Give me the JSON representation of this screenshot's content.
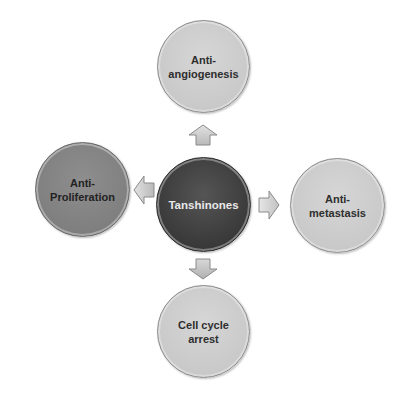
{
  "diagram": {
    "type": "radial-hub-and-spoke",
    "center": {
      "label": "Tanshinones"
    },
    "nodes": [
      {
        "position": "top",
        "label": "Anti-\nangiogenesis",
        "line1": "Anti-",
        "line2": "angiogenesis"
      },
      {
        "position": "left",
        "label": "Anti-\nProliferation",
        "line1": "Anti-",
        "line2": "Proliferation"
      },
      {
        "position": "right",
        "label": "Anti-\nmetastasis",
        "line1": "Anti-",
        "line2": "metastasis"
      },
      {
        "position": "bottom",
        "label": "Cell cycle\narrest",
        "line1": "Cell cycle",
        "line2": "arrest"
      }
    ],
    "arrows": [
      {
        "from": "Tanshinones",
        "to": "Anti-angiogenesis",
        "direction": "up"
      },
      {
        "from": "Tanshinones",
        "to": "Anti-Proliferation",
        "direction": "left"
      },
      {
        "from": "Tanshinones",
        "to": "Anti-metastasis",
        "direction": "right"
      },
      {
        "from": "Tanshinones",
        "to": "Cell cycle arrest",
        "direction": "down"
      }
    ],
    "colors": {
      "center_fill": "#3d3d3d",
      "center_text": "#e8e8e8",
      "light_fill": "#c9c9c9",
      "mid_fill": "#7f7f7f",
      "arrow_fill": "#c8c8c8",
      "arrow_stroke": "#8a8a8a"
    }
  }
}
